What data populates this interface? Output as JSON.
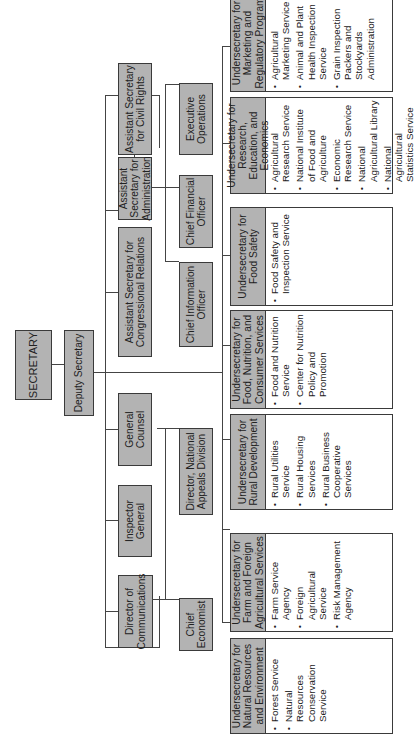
{
  "chart": {
    "orientation": "rotated-90-ccw",
    "colors": {
      "box_fill": "#b3b3b3",
      "border": "#3a3a3a",
      "line": "#444444",
      "background": "#ffffff"
    },
    "top": {
      "secretary": "SECRETARY",
      "deputy": "Deputy Secretary"
    },
    "staff_row1": [
      {
        "label": "Director of Communications"
      },
      {
        "label": "Inspector General"
      },
      {
        "label": "General Counsel"
      },
      {
        "label": "Assistant Secretary for Congressional Relations"
      },
      {
        "label": "Assistant Secretary for Administration"
      },
      {
        "label": "Assistant Secretary for Civil Rights"
      }
    ],
    "staff_row2": [
      {
        "label": "Chief Economist"
      },
      {
        "label": "Director, National Appeals Division"
      },
      {
        "label": "Chief Information Officer"
      },
      {
        "label": "Chief Financial Officer"
      },
      {
        "label": "Executive Operations"
      }
    ],
    "undersecretaries": [
      {
        "title": "Undersecretary for Natural Resources and Environment",
        "agencies": [
          "Forest Service",
          "Natural Resources Conservation Service"
        ]
      },
      {
        "title": "Undersecretary for Farm and Foreign Agricultural Services",
        "agencies": [
          "Farm Service Agency",
          "Foreign Agricultural Service",
          "Risk Management Agency"
        ]
      },
      {
        "title": "Undersecretary for Rural Development",
        "agencies": [
          "Rural Utilities Service",
          "Rural Housing Services",
          "Rural Business Cooperative Services"
        ]
      },
      {
        "title": "Undersecretary for Food, Nutrition, and Consumer Services",
        "agencies": [
          "Food and Nutrition Service",
          "Center for Nutrition Policy and Promotion"
        ]
      },
      {
        "title": "Undersecretary for Food Safety",
        "agencies": [
          "Food Safety and Inspection Service"
        ]
      },
      {
        "title": "Undersecretary for Research, Education, and Economics",
        "agencies": [
          "Agricultural Research Service",
          "National Institute of Food and Agriculture",
          "Economic Research Service",
          "National Agricultural Library",
          "National Agricultural Statistics Service"
        ]
      },
      {
        "title": "Undersecretary for Marketing and Regulatory Program",
        "agencies": [
          "Agricultural Marketing Service",
          "Animal and Plant Health Inspection Service",
          "Grain Inspection Packers and Stockyards Administration"
        ]
      }
    ]
  }
}
